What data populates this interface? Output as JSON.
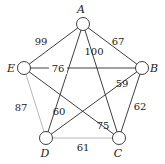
{
  "graph": {
    "nodes": [
      {
        "id": "A",
        "label": "A",
        "x": 83,
        "y": 24,
        "lx": 81,
        "ly": 13
      },
      {
        "id": "B",
        "label": "B",
        "x": 142,
        "y": 68,
        "lx": 154,
        "ly": 72
      },
      {
        "id": "C",
        "label": "C",
        "x": 119,
        "y": 138,
        "lx": 118,
        "ly": 157
      },
      {
        "id": "D",
        "label": "D",
        "x": 46,
        "y": 138,
        "lx": 45,
        "ly": 157
      },
      {
        "id": "E",
        "label": "E",
        "x": 24,
        "y": 68,
        "lx": 11,
        "ly": 72
      }
    ],
    "node_radius": 6.5,
    "edges": [
      {
        "from": "A",
        "to": "E",
        "weight": "99",
        "lx": 41,
        "ly": 45,
        "style": "dark"
      },
      {
        "from": "A",
        "to": "B",
        "weight": "67",
        "lx": 118,
        "ly": 45,
        "style": "dark"
      },
      {
        "from": "A",
        "to": "C",
        "weight": "100",
        "lx": 94,
        "ly": 55,
        "style": "dark"
      },
      {
        "from": "A",
        "to": "D",
        "weight": "60",
        "lx": 59,
        "ly": 115,
        "style": "dark"
      },
      {
        "from": "E",
        "to": "B",
        "weight": "76",
        "lx": 58,
        "ly": 72,
        "style": "dark",
        "bg": true
      },
      {
        "from": "E",
        "to": "C",
        "weight": "75",
        "lx": 103,
        "ly": 129,
        "style": "dark"
      },
      {
        "from": "E",
        "to": "D",
        "weight": "87",
        "lx": 21,
        "ly": 111,
        "style": "light"
      },
      {
        "from": "B",
        "to": "D",
        "weight": "59",
        "lx": 122,
        "ly": 87,
        "style": "dark"
      },
      {
        "from": "B",
        "to": "C",
        "weight": "62",
        "lx": 140,
        "ly": 110,
        "style": "dark"
      },
      {
        "from": "D",
        "to": "C",
        "weight": "61",
        "lx": 83,
        "ly": 151,
        "style": "light"
      }
    ]
  }
}
